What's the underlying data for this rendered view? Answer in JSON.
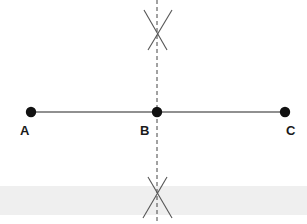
{
  "diagram": {
    "type": "perpendicular-bisector-construction",
    "colors": {
      "background": "#ffffff",
      "band": "#efefef",
      "ink": "#111111",
      "dashed": "#444444",
      "arc": "#555555"
    },
    "points": [
      {
        "id": "A",
        "label": "A",
        "x": 31,
        "y": 112,
        "label_x": 23,
        "label_y": 124
      },
      {
        "id": "B",
        "label": "B",
        "x": 157,
        "y": 112,
        "label_x": 141,
        "label_y": 124
      },
      {
        "id": "C",
        "label": "C",
        "x": 285,
        "y": 112,
        "label_x": 285,
        "label_y": 124
      }
    ],
    "segment": {
      "from": "A",
      "to": "C"
    },
    "bisector": {
      "x": 157,
      "style": "dashed"
    },
    "arc_intersections": [
      {
        "position": "top",
        "x": 157,
        "y": 30
      },
      {
        "position": "bottom",
        "x": 157,
        "y": 197
      }
    ]
  }
}
